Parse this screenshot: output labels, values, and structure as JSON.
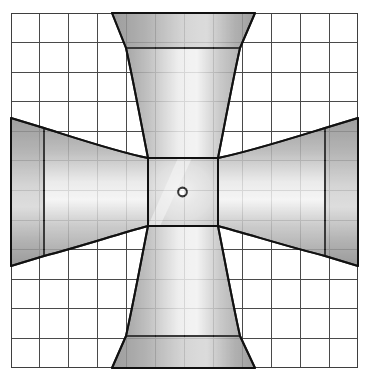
{
  "document": {
    "title": "Cruciform Flared Duct — Plan View",
    "kind": "technical-line-drawing",
    "background_color": "#ffffff",
    "canvas": {
      "width": 370,
      "height": 381
    }
  },
  "grid": {
    "name": "graph-paper-grid",
    "x0": 11,
    "y0": 13,
    "x1": 358,
    "y1": 368,
    "columns": 12,
    "rows": 12,
    "cell_width": 28.9,
    "cell_height": 29.6,
    "line_color": "#4a4a4a",
    "line_width": 1.1,
    "border_color": "#3a3a3a",
    "border_width": 1.4,
    "show": true
  },
  "object": {
    "name": "cruciform-four-arm-flared-duct",
    "outline_color": "#1a1a1a",
    "outline_width": 2.0,
    "fill_light": "#f2f2f2",
    "fill_mid": "#c8c8c8",
    "fill_dark": "#8e8e8e",
    "fill_darkest": "#7b7b7b",
    "center": {
      "name": "center-hub",
      "left": 148,
      "right": 218,
      "top": 158,
      "bottom": 226
    },
    "bore": {
      "name": "center-bore-hole",
      "cx": 182.5,
      "cy": 192,
      "r_outer": 5.4,
      "r_inner": 3.3,
      "ring_color": "#1a1a1a",
      "hole_color": "#ffffff"
    },
    "arms": [
      {
        "id": "arm-top",
        "label": "Top arm",
        "direction": "up",
        "throat_half_width": 35,
        "mouth_half_width": 71,
        "flange_outer_y": 13,
        "flange_inner_y": 48,
        "throat_y": 158
      },
      {
        "id": "arm-bottom",
        "label": "Bottom arm",
        "direction": "down",
        "throat_half_width": 35,
        "mouth_half_width": 71,
        "flange_outer_y": 368,
        "flange_inner_y": 336,
        "throat_y": 226
      },
      {
        "id": "arm-left",
        "label": "Left arm",
        "direction": "left",
        "throat_half_height": 34,
        "mouth_half_height": 72,
        "flange_outer_x": 11,
        "flange_inner_x": 44,
        "throat_x": 148
      },
      {
        "id": "arm-right",
        "label": "Right arm",
        "direction": "right",
        "throat_half_height": 34,
        "mouth_half_height": 72,
        "flange_outer_x": 358,
        "flange_inner_x": 325,
        "throat_x": 218
      }
    ]
  }
}
